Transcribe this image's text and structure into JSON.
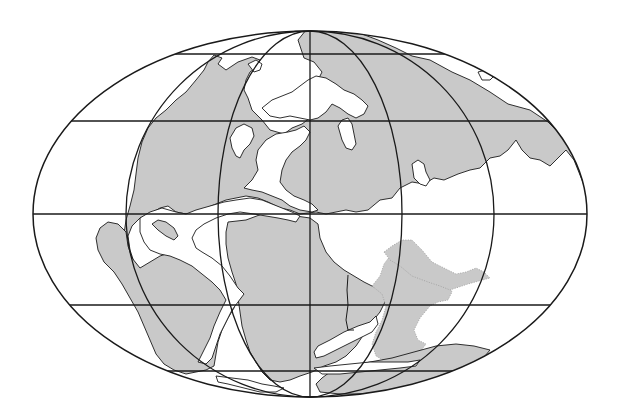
{
  "map": {
    "title": "",
    "projection": "Mollweide (elliptical equal-area)",
    "description": "Paleogeographic world map with gray continental landmasses and a latitude/longitude graticule",
    "colors": {
      "land": "#c9c9c9",
      "ocean": "#ffffff",
      "lines": "#1a1a1a",
      "background": "#ffffff"
    },
    "graticule": {
      "meridian_count": 5,
      "parallel_count": 5,
      "center": [
        310,
        214
      ],
      "radius_x": 277,
      "radius_y": 183
    },
    "features": [
      {
        "name": "Laurentia (North America)",
        "type": "continent"
      },
      {
        "name": "Greenland",
        "type": "continent"
      },
      {
        "name": "Baltica / Europe",
        "type": "continent"
      },
      {
        "name": "Siberia / Asia",
        "type": "continent"
      },
      {
        "name": "Gondwana (South America / Africa)",
        "type": "continent"
      },
      {
        "name": "Tethys seaway",
        "type": "ocean"
      },
      {
        "name": "Proto-Atlantic rift",
        "type": "ocean"
      }
    ]
  }
}
